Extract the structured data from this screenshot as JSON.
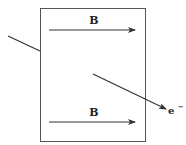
{
  "diagram": {
    "field_labels": [
      "B",
      "B"
    ],
    "particle_label": "e",
    "particle_charge": "−",
    "colors": {
      "stroke": "#333333",
      "background": "#ffffff"
    }
  }
}
